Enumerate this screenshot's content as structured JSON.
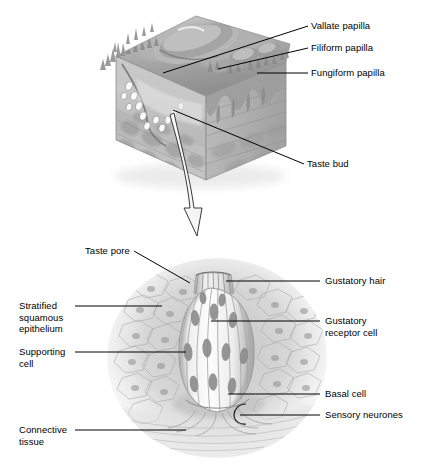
{
  "figure": {
    "title_visible": false,
    "style": "grayscale pencil-shaded anatomical illustration",
    "background_color": "#ffffff",
    "line_color": "#000000",
    "panels": [
      {
        "id": "tongue-surface-block",
        "description": "cut-away block of tongue surface showing papillae and an embedded taste bud"
      },
      {
        "id": "taste-bud-detail",
        "description": "magnified taste bud within stratified squamous epithelium"
      }
    ],
    "connector": {
      "name": "magnification-arrow",
      "shape": "curved-hollow-down-arrow"
    }
  },
  "labels": {
    "vallate_papilla": "Vallate papilla",
    "filiform_papilla": "Filiform papilla",
    "fungiform_papilla": "Fungiform papilla",
    "taste_bud": "Taste bud",
    "taste_pore": "Taste pore",
    "gustatory_hair": "Gustatory hair",
    "gustatory_receptor_cell_1": "Gustatory",
    "gustatory_receptor_cell_2": "receptor cell",
    "basal_cell": "Basal cell",
    "sensory_neurones": "Sensory neurones",
    "stratified_1": "Stratified",
    "stratified_2": "squamous",
    "stratified_3": "epithelium",
    "supporting_1": "Supporting",
    "supporting_2": "cell",
    "connective_1": "Connective",
    "connective_2": "tissue"
  },
  "colors": {
    "ink": "#000000",
    "tissue_mid": "#9a9a9a",
    "tissue_dark": "#6f6f6f",
    "tissue_light": "#cfcfcf",
    "tissue_pale": "#e8e8e8",
    "paper": "#ffffff"
  }
}
